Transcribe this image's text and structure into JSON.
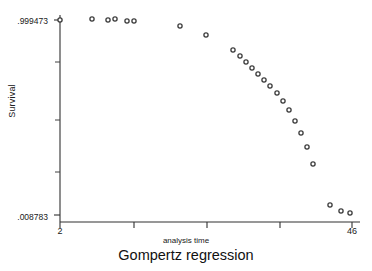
{
  "chart_data": {
    "type": "scatter",
    "title": "Gompertz regression",
    "xlabel": "analysis time",
    "ylabel": "Survival",
    "xlim": [
      2,
      46
    ],
    "ylim": [
      0.008783,
      0.999473
    ],
    "grid": false,
    "legend": null,
    "marker": "open-circle",
    "y_ticks": [
      {
        "value": 0.999473,
        "label": ".999473"
      },
      {
        "value": 0.008783,
        "label": ".008783"
      }
    ],
    "y_minor_ticks": [
      0.75,
      0.42,
      0.14
    ],
    "x_ticks": [
      {
        "value": 2,
        "label": "2"
      },
      {
        "value": 13,
        "label": ""
      },
      {
        "value": 24,
        "label": ""
      },
      {
        "value": 35,
        "label": ""
      },
      {
        "value": 46,
        "label": "46"
      }
    ],
    "x": [
      2.0,
      6.8,
      9.2,
      10.3,
      12.1,
      13.2,
      20.0,
      23.9,
      27.9,
      29.0,
      29.8,
      30.9,
      32.0,
      32.9,
      34.0,
      35.0,
      36.1,
      37.2,
      38.3,
      39.4,
      40.5,
      41.6,
      43.9,
      45.0,
      45.7
    ],
    "y": [
      0.9995,
      0.996,
      0.996,
      0.996,
      0.993,
      0.993,
      0.95,
      0.903,
      0.818,
      0.797,
      0.772,
      0.743,
      0.717,
      0.687,
      0.654,
      0.618,
      0.575,
      0.527,
      0.471,
      0.407,
      0.332,
      0.243,
      0.072,
      0.043,
      0.034
    ],
    "points_px": [
      [
        60,
        20
      ],
      [
        92,
        19
      ],
      [
        108,
        20
      ],
      [
        115,
        19
      ],
      [
        127,
        21
      ],
      [
        134,
        21
      ],
      [
        180,
        26
      ],
      [
        206,
        35
      ],
      [
        233,
        50
      ],
      [
        240,
        56
      ],
      [
        246,
        62
      ],
      [
        252,
        68
      ],
      [
        258,
        74
      ],
      [
        264,
        80
      ],
      [
        270,
        86
      ],
      [
        277,
        93
      ],
      [
        283,
        101
      ],
      [
        289,
        110
      ],
      [
        295,
        121
      ],
      [
        301,
        133
      ],
      [
        307,
        147
      ],
      [
        313,
        164
      ],
      [
        330,
        205
      ],
      [
        341,
        211
      ],
      [
        350,
        213
      ]
    ]
  }
}
